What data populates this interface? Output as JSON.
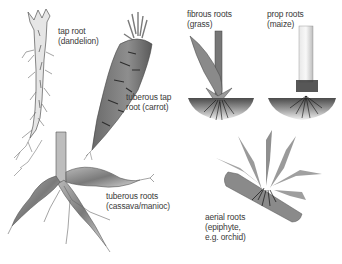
{
  "diagram": {
    "background": "#ffffff",
    "ink_color": "#3a3a3a",
    "labels": [
      {
        "id": "tap-root",
        "line1": "tap root",
        "line2": "(dandelion)",
        "x": 58,
        "y": 26
      },
      {
        "id": "tuberous-tap-root",
        "line1": "tuberous tap",
        "line2": "root (carrot)",
        "x": 126,
        "y": 92
      },
      {
        "id": "tuberous-roots",
        "line1": "tuberous roots",
        "line2": "(cassava/manioc)",
        "x": 106,
        "y": 191
      },
      {
        "id": "fibrous-roots",
        "line1": "fibrous roots",
        "line2": "(grass)",
        "x": 187,
        "y": 9
      },
      {
        "id": "prop-roots",
        "line1": "prop roots",
        "line2": "(maize)",
        "x": 267,
        "y": 9
      },
      {
        "id": "aerial-roots",
        "line1": "aerial roots",
        "line2": "(epiphyte,",
        "line3": "e.g. orchid)",
        "x": 205,
        "y": 212
      }
    ],
    "illustrations": [
      "dandelion-tap-root",
      "carrot-tuberous-tap-root",
      "cassava-tuberous-roots",
      "grass-fibrous-roots",
      "maize-prop-roots",
      "orchid-aerial-roots"
    ]
  }
}
